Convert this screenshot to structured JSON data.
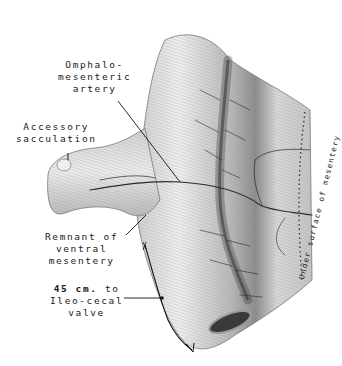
{
  "figure": {
    "type": "anatomical-illustration",
    "colors": {
      "background": "#ffffff",
      "ink": "#1a1a1a",
      "tissue_light": "#e6e6e6",
      "tissue_mid": "#bdbdbd",
      "tissue_dark": "#555555",
      "vessel": "#2b2b2b"
    }
  },
  "labels": {
    "omphalo": {
      "line1": "Omphalo-",
      "line2": "mesenteric",
      "line3": "artery"
    },
    "accessory": {
      "line1": "Accessory",
      "line2": "sacculation"
    },
    "remnant": {
      "line1": "Remnant of",
      "line2": "ventral",
      "line3": "mesentery"
    },
    "distance": {
      "line1_num": "45 cm.",
      "line1_rest": " to",
      "line2": "Ileo-cecal",
      "line3": "valve"
    },
    "under_surface": "Under surface of mesentery"
  }
}
